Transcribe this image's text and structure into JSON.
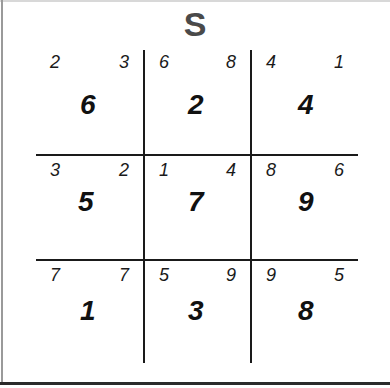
{
  "title": "S",
  "grid": {
    "rows": [
      [
        {
          "small_left": "2",
          "small_right": "3",
          "value": "6"
        },
        {
          "small_left": "6",
          "small_right": "8",
          "value": "2"
        },
        {
          "small_left": "4",
          "small_right": "1",
          "value": "4"
        }
      ],
      [
        {
          "small_left": "3",
          "small_right": "2",
          "value": "5"
        },
        {
          "small_left": "1",
          "small_right": "4",
          "value": "7"
        },
        {
          "small_left": "8",
          "small_right": "6",
          "value": "9"
        }
      ],
      [
        {
          "small_left": "7",
          "small_right": "7",
          "value": "1"
        },
        {
          "small_left": "5",
          "small_right": "9",
          "value": "3"
        },
        {
          "small_left": "9",
          "small_right": "5",
          "value": "8"
        }
      ]
    ]
  }
}
